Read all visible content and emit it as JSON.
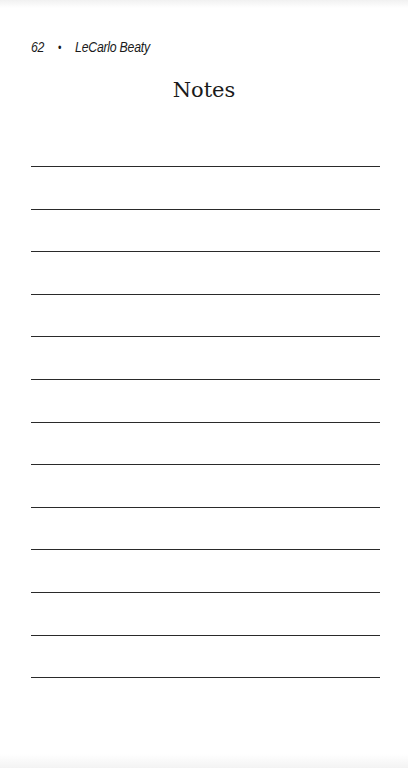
{
  "header": {
    "page_number": "62",
    "separator": "•",
    "author": "LeCarlo Beaty"
  },
  "title": "Notes",
  "ruled_lines": {
    "count": 13,
    "first_y": 166,
    "spacing": 42.6
  }
}
